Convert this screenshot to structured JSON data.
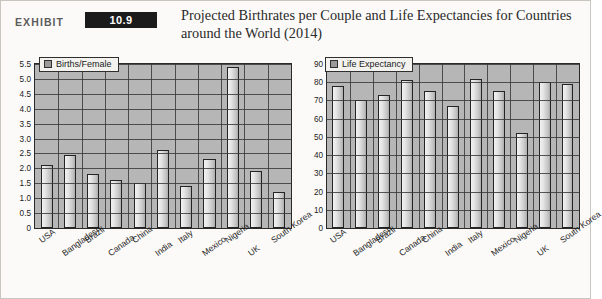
{
  "header": {
    "exhibit_word": "EXHIBIT",
    "exhibit_number": "10.9",
    "title": "Projected Birthrates per Couple and Life Expectancies for Countries around the World (2014)"
  },
  "colors": {
    "exhibit_badge_bg": "#1b1b1b",
    "exhibit_badge_text": "#ffffff",
    "page_bg": "#fbfaf8",
    "plot_bg": "#b6b6b6",
    "grid": "#3a3a3a",
    "bar_fill": "#e3e3e3",
    "bar_outline": "#242424",
    "legend_swatch": "#9a9a9a"
  },
  "chart_data": [
    {
      "type": "bar",
      "id": "births-per-female",
      "title": "",
      "xlabel": "",
      "ylabel": "",
      "legend": "Births/Female",
      "legend_position": "top-left",
      "grid": true,
      "ylim": [
        0,
        5.5
      ],
      "ytick_step": 0.5,
      "yticks": [
        "0",
        "0.5",
        "1.0",
        "1.5",
        "2.0",
        "2.5",
        "3.0",
        "3.5",
        "4.0",
        "4.5",
        "5.0",
        "5.5"
      ],
      "categories": [
        "USA",
        "Bangladesh",
        "Brazil",
        "Canada",
        "China",
        "India",
        "Italy",
        "Mexico",
        "Nigeria",
        "UK",
        "South Korea"
      ],
      "values": [
        2.1,
        2.45,
        1.8,
        1.6,
        1.5,
        2.6,
        1.4,
        2.3,
        5.4,
        1.9,
        1.2
      ]
    },
    {
      "type": "bar",
      "id": "life-expectancy",
      "title": "",
      "xlabel": "",
      "ylabel": "",
      "legend": "Life Expectancy",
      "legend_position": "top-left",
      "grid": true,
      "ylim": [
        0,
        90
      ],
      "ytick_step": 10,
      "yticks": [
        "0",
        "10",
        "20",
        "30",
        "40",
        "50",
        "60",
        "70",
        "80",
        "90"
      ],
      "categories": [
        "USA",
        "Bangladesh",
        "Brazil",
        "Canada",
        "China",
        "India",
        "Italy",
        "Mexico",
        "Nigeria",
        "UK",
        "South Korea"
      ],
      "values": [
        78,
        70,
        73,
        81,
        75,
        67,
        82,
        75,
        52,
        80,
        79
      ]
    }
  ]
}
